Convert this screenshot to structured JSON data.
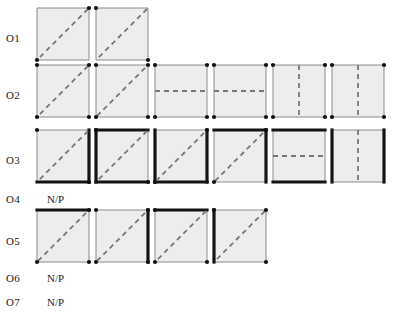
{
  "figure": {
    "title": "",
    "background": "#ffffff",
    "face_fill": "#ededed",
    "thin_edge_color": "#8a8a8a",
    "bold_edge_color": "#141414",
    "dash_color": "#777777",
    "vertex_color": "#111111",
    "square_size": 52,
    "rows": [
      {
        "label": "O1",
        "label_x": 6,
        "label_y": 33,
        "note": null,
        "cells": [
          {
            "x": 37,
            "y": 8,
            "bold_edges": [],
            "dash": "diag-down",
            "vertices": [
              "tr",
              "bl"
            ]
          },
          {
            "x": 96,
            "y": 8,
            "bold_edges": [],
            "dash": "diag-down",
            "vertices": [
              "tl",
              "br"
            ]
          }
        ]
      },
      {
        "label": "O2",
        "label_x": 6,
        "label_y": 90,
        "note": null,
        "cells": [
          {
            "x": 37,
            "y": 65,
            "bold_edges": [],
            "dash": "diag-down",
            "vertices": [
              "tl",
              "tr",
              "bl",
              "br"
            ]
          },
          {
            "x": 96,
            "y": 65,
            "bold_edges": [],
            "dash": "diag-up",
            "vertices": [
              "tl",
              "tr",
              "bl",
              "br"
            ]
          },
          {
            "x": 155,
            "y": 65,
            "bold_edges": [],
            "dash": "horizontal",
            "vertices": [
              "tl",
              "tr",
              "bl",
              "br"
            ]
          },
          {
            "x": 214,
            "y": 65,
            "bold_edges": [],
            "dash": "horizontal",
            "vertices": [
              "tl",
              "tr",
              "bl",
              "br"
            ]
          },
          {
            "x": 273,
            "y": 65,
            "bold_edges": [],
            "dash": "vertical",
            "vertices": [
              "tl",
              "tr",
              "bl",
              "br"
            ]
          },
          {
            "x": 332,
            "y": 65,
            "bold_edges": [],
            "dash": "vertical",
            "vertices": [
              "tl",
              "tr",
              "bl",
              "br"
            ]
          }
        ]
      },
      {
        "label": "O3",
        "label_x": 6,
        "label_y": 155,
        "note": null,
        "cells": [
          {
            "x": 37,
            "y": 130,
            "bold_edges": [
              "right",
              "bottom"
            ],
            "dash": "diag-down",
            "vertices": [
              "tl",
              "br"
            ]
          },
          {
            "x": 96,
            "y": 130,
            "bold_edges": [
              "top",
              "left",
              "bottom"
            ],
            "dash": "diag-down",
            "vertices": [
              "tl",
              "br"
            ]
          },
          {
            "x": 155,
            "y": 130,
            "bold_edges": [
              "left",
              "bottom",
              "right"
            ],
            "dash": "diag-up",
            "vertices": [
              "tr",
              "bl"
            ]
          },
          {
            "x": 214,
            "y": 130,
            "bold_edges": [
              "top",
              "right"
            ],
            "dash": "diag-up",
            "vertices": [
              "tr",
              "bl"
            ]
          },
          {
            "x": 273,
            "y": 130,
            "bold_edges": [
              "top",
              "bottom"
            ],
            "dash": "horizontal",
            "vertices": []
          },
          {
            "x": 332,
            "y": 130,
            "bold_edges": [
              "left",
              "right"
            ],
            "dash": "vertical",
            "vertices": []
          }
        ]
      },
      {
        "label": "O4",
        "label_x": 6,
        "label_y": 194,
        "note": "N/P",
        "note_x": 47,
        "note_y": 194,
        "cells": []
      },
      {
        "label": "O5",
        "label_x": 6,
        "label_y": 236,
        "note": null,
        "cells": [
          {
            "x": 37,
            "y": 210,
            "bold_edges": [
              "top"
            ],
            "dash": "diag-up",
            "vertices": [
              "tr",
              "bl",
              "br"
            ]
          },
          {
            "x": 96,
            "y": 210,
            "bold_edges": [
              "right"
            ],
            "dash": "diag-up",
            "vertices": [
              "tl",
              "tr",
              "bl",
              "br"
            ]
          },
          {
            "x": 155,
            "y": 210,
            "bold_edges": [
              "top"
            ],
            "dash": "diag-down",
            "vertices": [
              "tl",
              "bl",
              "br"
            ]
          },
          {
            "x": 214,
            "y": 210,
            "bold_edges": [
              "left"
            ],
            "dash": "diag-down",
            "vertices": [
              "tl",
              "tr",
              "br"
            ]
          }
        ]
      },
      {
        "label": "O6",
        "label_x": 6,
        "label_y": 273,
        "note": "N/P",
        "note_x": 47,
        "note_y": 273,
        "cells": []
      },
      {
        "label": "O7",
        "label_x": 6,
        "label_y": 297,
        "note": "N/P",
        "note_x": 47,
        "note_y": 297,
        "cells": []
      }
    ]
  }
}
